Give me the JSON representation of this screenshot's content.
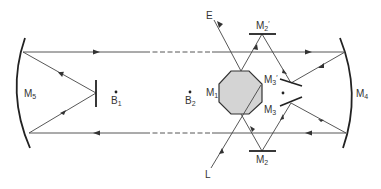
{
  "diagram": {
    "title": "",
    "labels": {
      "M5": {
        "main": "M",
        "sub": "5"
      },
      "B1": {
        "main": "B",
        "sub": "1"
      },
      "B2": {
        "main": "B",
        "sub": "2"
      },
      "M1": {
        "main": "M",
        "sub": "1"
      },
      "M2p": {
        "main": "M",
        "sub": "2",
        "prime": "′"
      },
      "M3p": {
        "main": "M",
        "sub": "3",
        "prime": "′"
      },
      "M3": {
        "main": "M",
        "sub": "3"
      },
      "M2": {
        "main": "M",
        "sub": "2"
      },
      "M4": {
        "main": "M",
        "sub": "4"
      },
      "E": "E",
      "L": "L"
    },
    "colors": {
      "line": "#444444",
      "mirror": "#222222",
      "octagon_fill": "#d4d4d4",
      "background": "#ffffff"
    },
    "components": [
      "curved mirror M5 (left)",
      "flat mirror (center-left)",
      "points B1 and B2",
      "rotating octagonal mirror M1",
      "flat mirrors M2 and M2′",
      "flat mirrors M3 and M3′",
      "curved mirror M4 (right)",
      "input beam L",
      "output beam E"
    ]
  }
}
